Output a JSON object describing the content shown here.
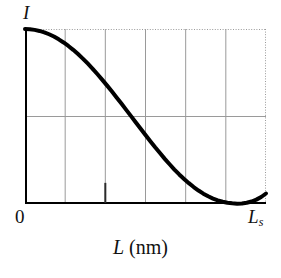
{
  "figure": {
    "labels": {
      "y_axis": "I",
      "x_origin": "0",
      "x_max_base": "L",
      "x_max_sub": "s",
      "x_axis_italic": "L",
      "x_axis_roman": " (nm)"
    }
  },
  "chart_data": {
    "type": "line",
    "title": "",
    "subtitle": "",
    "xlabel": "L (nm)",
    "ylabel": "I",
    "xlim": [
      0,
      1
    ],
    "ylim": [
      0,
      1
    ],
    "x_tick_labels": [
      "0",
      "Ls"
    ],
    "y_tick_labels": [],
    "grid": true,
    "grid_x_fractions": [
      0.0,
      0.1667,
      0.3333,
      0.5,
      0.6667,
      0.8333,
      1.0
    ],
    "grid_y_fractions": [
      0.0,
      0.5,
      1.0
    ],
    "grid_color": "#9a9a9a",
    "grid_dotted_top_right": true,
    "axis_color": "#000000",
    "curve_color": "#000000",
    "curve_width_px": 4,
    "legend": null,
    "legend_position": "none",
    "annotations": [
      {
        "name": "x-tick-mark",
        "x_fraction": 0.3333,
        "height_fraction": 0.115,
        "color": "#2b2b2b"
      }
    ],
    "series": [
      {
        "name": "intensity",
        "x": [
          0.0,
          0.02,
          0.04,
          0.06,
          0.08,
          0.1,
          0.12,
          0.14,
          0.16,
          0.18,
          0.2,
          0.22,
          0.24,
          0.26,
          0.28,
          0.3,
          0.32,
          0.34,
          0.36,
          0.38,
          0.4,
          0.42,
          0.44,
          0.46,
          0.48,
          0.5,
          0.52,
          0.54,
          0.56,
          0.58,
          0.6,
          0.62,
          0.64,
          0.66,
          0.68,
          0.7,
          0.72,
          0.74,
          0.76,
          0.78,
          0.8,
          0.82,
          0.84,
          0.86,
          0.88,
          0.9,
          0.92,
          0.94,
          0.96,
          0.98,
          1.0
        ],
        "y": [
          1.0,
          0.999,
          0.995,
          0.989,
          0.981,
          0.97,
          0.957,
          0.941,
          0.923,
          0.903,
          0.881,
          0.857,
          0.831,
          0.803,
          0.774,
          0.743,
          0.711,
          0.678,
          0.644,
          0.609,
          0.574,
          0.538,
          0.502,
          0.466,
          0.43,
          0.394,
          0.359,
          0.324,
          0.291,
          0.258,
          0.227,
          0.197,
          0.169,
          0.143,
          0.119,
          0.097,
          0.077,
          0.059,
          0.044,
          0.031,
          0.021,
          0.013,
          0.007,
          0.004,
          0.002,
          0.003,
          0.007,
          0.014,
          0.025,
          0.04,
          0.06
        ]
      }
    ]
  }
}
